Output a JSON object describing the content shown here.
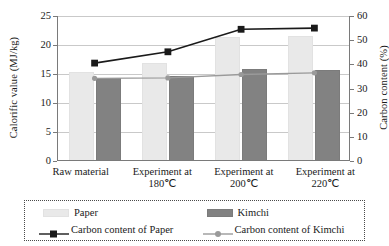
{
  "chart_data": {
    "type": "bar",
    "title": "",
    "subtitle": "",
    "categories": [
      "Raw material",
      "Experiment at 180℃",
      "Experiment at 200℃",
      "Experiment at 220℃"
    ],
    "category_lines": [
      [
        "Raw material",
        ""
      ],
      [
        "Experiment at",
        "180℃"
      ],
      [
        "Experiment at",
        "200℃"
      ],
      [
        "Experiment at",
        "220℃"
      ]
    ],
    "xlabel": "",
    "ylabel": "Calorific value (MJ/kg)",
    "y2label": "Carbon content (%)",
    "ylim": [
      0,
      25
    ],
    "y2lim": [
      0,
      60
    ],
    "yticks": [
      0,
      5,
      10,
      15,
      20,
      25
    ],
    "y2ticks": [
      0,
      10,
      20,
      30,
      40,
      50,
      60
    ],
    "grid": true,
    "legend_position": "bottom",
    "series": [
      {
        "name": "Paper",
        "kind": "bar",
        "axis": "left",
        "color": "#e9e9e9",
        "values": [
          15.4,
          16.9,
          21.3,
          21.6
        ]
      },
      {
        "name": "Kimchi",
        "kind": "bar",
        "axis": "left",
        "color": "#828282",
        "values": [
          14.3,
          14.7,
          15.9,
          15.7
        ]
      },
      {
        "name": "Carbon content of Paper",
        "kind": "line",
        "axis": "right",
        "color": "#1a1a1a",
        "marker": "square",
        "values": [
          40.5,
          45.2,
          54.5,
          55.0
        ]
      },
      {
        "name": "Carbon content of Kimchi",
        "kind": "line",
        "axis": "right",
        "color": "#9a9a9a",
        "marker": "circle",
        "values": [
          34.2,
          34.4,
          35.8,
          36.5
        ]
      }
    ]
  },
  "axes": {
    "left_title": "Calorific value (MJ/kg)",
    "right_title": "Carbon content (%)",
    "left_ticks": [
      "0",
      "5",
      "10",
      "15",
      "20",
      "25"
    ],
    "right_ticks": [
      "0",
      "10",
      "20",
      "30",
      "40",
      "50",
      "60"
    ]
  },
  "legend": {
    "items": [
      {
        "label": "Paper",
        "type": "bar",
        "color": "#e9e9e9"
      },
      {
        "label": "Kimchi",
        "type": "bar",
        "color": "#828282"
      },
      {
        "label": "Carbon content of Paper",
        "type": "line-square",
        "color": "#1a1a1a"
      },
      {
        "label": "Carbon content of Kimchi",
        "type": "line-circle",
        "color": "#9a9a9a"
      }
    ]
  }
}
